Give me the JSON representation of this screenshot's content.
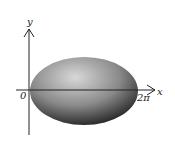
{
  "diagram": {
    "axes": {
      "x_label": "x",
      "y_label": "y"
    },
    "ticks": {
      "origin": "0",
      "x_end": "2π"
    },
    "shape": {
      "type": "shaded-ellipse",
      "fill_light": "#c8c8c8",
      "fill_dark": "#1e1e1e"
    }
  }
}
